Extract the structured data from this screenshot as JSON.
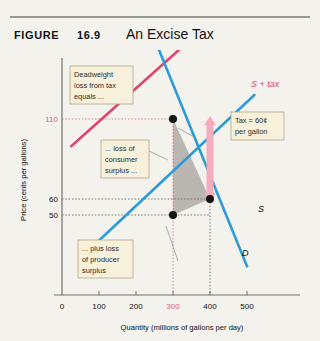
{
  "header": {
    "figure_word": "FIGURE",
    "figure_number": "16.9",
    "title": "An Excise Tax"
  },
  "callouts": {
    "deadweight": "Deadweight loss from tax equals ...",
    "consumer": "... loss of consumer surplus ...",
    "producer": "... plus loss of producer surplus",
    "tax": "Tax = 60¢ per gallon"
  },
  "callout_lines": {
    "deadweight": [
      "Deadweight",
      "loss from tax",
      "equals ..."
    ],
    "consumer": [
      "... loss of",
      "consumer",
      "surplus ..."
    ],
    "producer": [
      "... plus loss",
      "of producer",
      "surplus"
    ],
    "tax": [
      "Tax = 60¢",
      "per gallon"
    ]
  },
  "colors": {
    "supply": "#2e9bd6",
    "demand": "#2e9bd6",
    "supply_tax": "#e0456e",
    "highlight": "#e0607f",
    "deadweight_fill": "#a9a6a3",
    "callout_bg": "#f7f0da",
    "callout_border": "#b3a98c",
    "page_bg": "#f3f2ed",
    "axis": "#6f6f6f",
    "arrow": "#f2aebd"
  },
  "chart_data": {
    "type": "line",
    "title": "An Excise Tax",
    "xlabel": "Quantity (millions of gallons per day)",
    "ylabel": "Price (cents per gallons)",
    "xlim": [
      0,
      560
    ],
    "ylim": [
      0,
      160
    ],
    "xticks": [
      0,
      100,
      200,
      300,
      400,
      500
    ],
    "yticks": [
      50,
      60,
      110
    ],
    "highlight_xtick": 300,
    "highlight_ytick": 110,
    "grid": false,
    "series": [
      {
        "name": "S",
        "label": "S",
        "color": "#2e9bd6",
        "points": [
          [
            95,
            33
          ],
          [
            520,
            125
          ]
        ]
      },
      {
        "name": "S + tax",
        "label": "S + tax",
        "color": "#e0456e",
        "points": [
          [
            25,
            93
          ],
          [
            470,
            185
          ]
        ]
      },
      {
        "name": "D",
        "label": "D",
        "color": "#2e9bd6",
        "points": [
          [
            215,
            180
          ],
          [
            500,
            18
          ]
        ]
      }
    ],
    "points_marked": [
      {
        "name": "after-tax-equilibrium",
        "x": 300,
        "y": 110
      },
      {
        "name": "pre-tax-equilibrium",
        "x": 400,
        "y": 60
      },
      {
        "name": "producer-price-point",
        "x": 300,
        "y": 50
      }
    ],
    "shaded_region": {
      "name": "deadweight-loss-triangle",
      "vertices": [
        [
          300,
          110
        ],
        [
          400,
          60
        ],
        [
          300,
          50
        ]
      ],
      "fill": "#a9a6a3"
    },
    "annotations": [
      {
        "name": "tax-arrow",
        "text": "Tax = 60¢ per gallon",
        "x": 400,
        "from_y": 60,
        "to_y": 110
      },
      {
        "name": "deadweight-note",
        "text": "Deadweight loss from tax equals ..."
      },
      {
        "name": "consumer-note",
        "text": "... loss of consumer surplus ..."
      },
      {
        "name": "producer-note",
        "text": "... plus loss of producer surplus"
      }
    ]
  }
}
